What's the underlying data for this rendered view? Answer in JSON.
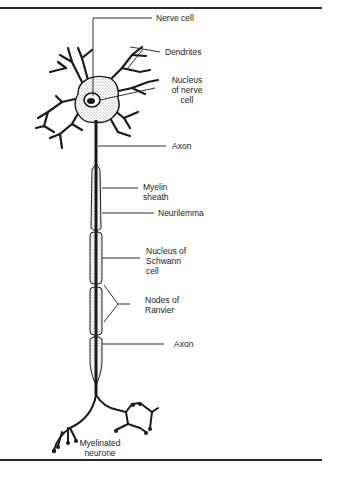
{
  "figure": {
    "title": "Myelinated neurone",
    "labels": {
      "nerve_cell": "Nerve cell",
      "dendrites": "Dendrites",
      "nucleus_of_nerve_cell": "Nucleus\nof nerve\ncell",
      "axon_top": "Axon",
      "myelin_sheath": "Myelin\nsheath",
      "neurilemma": "Neurilemma",
      "nucleus_of_schwann_cell": "Nucleus of\nSchwann\ncell",
      "nodes_of_ranvier": "Nodes of\nRanvier",
      "axon_bottom": "Axon",
      "caption": "Myelinated\nneurone"
    },
    "colors": {
      "ink": "#1a1a1a",
      "stipple": "#8a8a8a",
      "background": "#ffffff"
    }
  }
}
